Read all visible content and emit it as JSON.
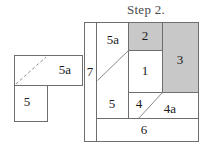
{
  "title": {
    "text": "Step 2."
  },
  "colors": {
    "shaded_fill": "#c8c8c8",
    "plain_fill": "#ffffff",
    "stroke": "#6e6e6e",
    "text": "#1a1a1a",
    "background": "#ffffff"
  },
  "left_shape": {
    "name": "L-shaped piece",
    "labels": [
      {
        "id": "left-label-5a",
        "text": "5a"
      },
      {
        "id": "left-label-5",
        "text": "5"
      }
    ],
    "has_dashed_diagonal": true
  },
  "main_figure": {
    "name": "square dissection",
    "labels": [
      {
        "id": "label-7",
        "text": "7",
        "shaded": false
      },
      {
        "id": "label-5a",
        "text": "5a",
        "shaded": false
      },
      {
        "id": "label-2",
        "text": "2",
        "shaded": true
      },
      {
        "id": "label-3",
        "text": "3",
        "shaded": true
      },
      {
        "id": "label-1",
        "text": "1",
        "shaded": false
      },
      {
        "id": "label-5",
        "text": "5",
        "shaded": false
      },
      {
        "id": "label-4",
        "text": "4",
        "shaded": false
      },
      {
        "id": "label-4a",
        "text": "4a",
        "shaded": false
      },
      {
        "id": "label-6",
        "text": "6",
        "shaded": false
      }
    ],
    "shaded_pieces": [
      "2",
      "3"
    ],
    "diagonal_cuts": 2
  }
}
